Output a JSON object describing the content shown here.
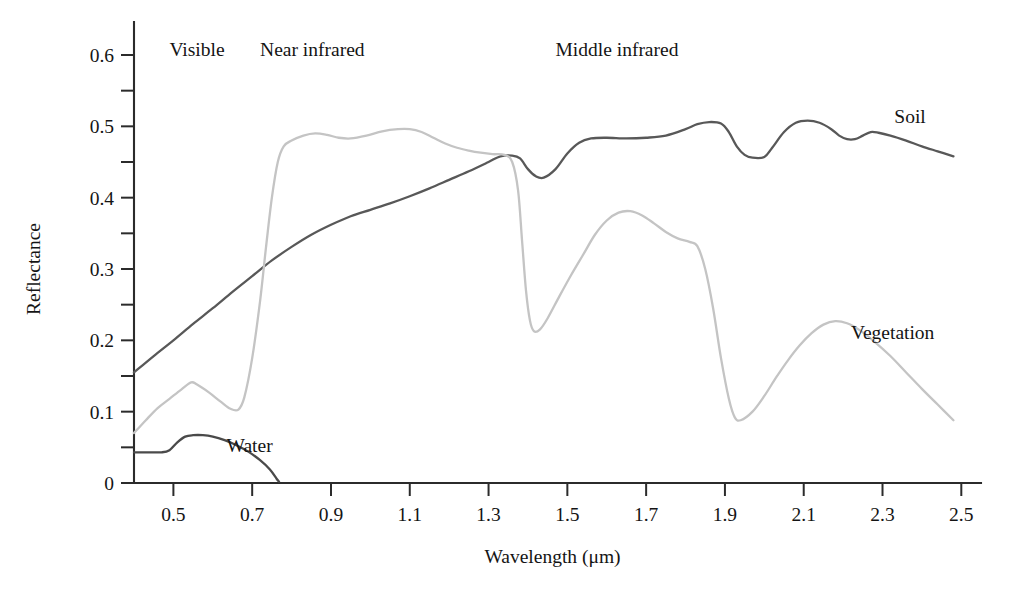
{
  "chart_data": {
    "type": "line",
    "title": "",
    "xlabel": "Wavelength (μm)",
    "ylabel": "Reflectance",
    "xlim": [
      0.4,
      2.55
    ],
    "ylim": [
      0,
      0.625
    ],
    "grid": false,
    "legend_position": "inline-right",
    "xticks": [
      0.5,
      0.7,
      0.9,
      1.1,
      1.3,
      1.5,
      1.7,
      1.9,
      2.1,
      2.3,
      2.5
    ],
    "xticklabels": [
      "0.5",
      "0.7",
      "0.9",
      "1.1",
      "1.3",
      "1.5",
      "1.7",
      "1.9",
      "2.1",
      "2.3",
      "2.5"
    ],
    "xticks_minor": [
      0.4,
      0.6,
      0.8,
      1.0,
      1.2,
      1.4,
      1.6,
      1.8,
      2.0,
      2.2,
      2.4
    ],
    "yticks": [
      0,
      0.1,
      0.2,
      0.3,
      0.4,
      0.5,
      0.6
    ],
    "yticklabels": [
      "0",
      "0.1",
      "0.2",
      "0.3",
      "0.4",
      "0.5",
      "0.6"
    ],
    "yticks_minor": [
      0.05,
      0.15,
      0.25,
      0.35,
      0.45,
      0.55
    ],
    "band_annotations": [
      {
        "name": "visible",
        "label": "Visible",
        "x": 0.49
      },
      {
        "name": "near-infrared",
        "label": "Near infrared",
        "x": 0.72
      },
      {
        "name": "middle-infrared",
        "label": "Middle infrared",
        "x": 1.47
      }
    ],
    "series": [
      {
        "name": "soil",
        "label": "Soil",
        "color": "#585858",
        "label_x": 2.33,
        "label_y": 0.515,
        "points": [
          [
            0.4,
            0.155
          ],
          [
            0.45,
            0.178
          ],
          [
            0.5,
            0.2
          ],
          [
            0.55,
            0.223
          ],
          [
            0.6,
            0.245
          ],
          [
            0.65,
            0.268
          ],
          [
            0.7,
            0.29
          ],
          [
            0.75,
            0.312
          ],
          [
            0.8,
            0.331
          ],
          [
            0.85,
            0.348
          ],
          [
            0.9,
            0.362
          ],
          [
            0.95,
            0.374
          ],
          [
            1.0,
            0.383
          ],
          [
            1.05,
            0.392
          ],
          [
            1.1,
            0.402
          ],
          [
            1.15,
            0.413
          ],
          [
            1.2,
            0.425
          ],
          [
            1.25,
            0.437
          ],
          [
            1.3,
            0.45
          ],
          [
            1.33,
            0.458
          ],
          [
            1.36,
            0.459
          ],
          [
            1.38,
            0.455
          ],
          [
            1.4,
            0.44
          ],
          [
            1.42,
            0.43
          ],
          [
            1.44,
            0.428
          ],
          [
            1.47,
            0.44
          ],
          [
            1.5,
            0.462
          ],
          [
            1.53,
            0.477
          ],
          [
            1.56,
            0.483
          ],
          [
            1.6,
            0.484
          ],
          [
            1.65,
            0.483
          ],
          [
            1.7,
            0.484
          ],
          [
            1.75,
            0.487
          ],
          [
            1.8,
            0.496
          ],
          [
            1.83,
            0.503
          ],
          [
            1.86,
            0.506
          ],
          [
            1.89,
            0.504
          ],
          [
            1.91,
            0.492
          ],
          [
            1.93,
            0.472
          ],
          [
            1.95,
            0.46
          ],
          [
            1.97,
            0.456
          ],
          [
            2.0,
            0.457
          ],
          [
            2.02,
            0.47
          ],
          [
            2.05,
            0.492
          ],
          [
            2.08,
            0.505
          ],
          [
            2.11,
            0.508
          ],
          [
            2.14,
            0.505
          ],
          [
            2.17,
            0.496
          ],
          [
            2.19,
            0.487
          ],
          [
            2.21,
            0.482
          ],
          [
            2.23,
            0.482
          ],
          [
            2.25,
            0.487
          ],
          [
            2.27,
            0.492
          ],
          [
            2.29,
            0.491
          ],
          [
            2.32,
            0.487
          ],
          [
            2.36,
            0.48
          ],
          [
            2.4,
            0.472
          ],
          [
            2.44,
            0.465
          ],
          [
            2.48,
            0.458
          ]
        ]
      },
      {
        "name": "vegetation",
        "label": "Vegetation",
        "color": "#c4c4c4",
        "label_x": 2.22,
        "label_y": 0.212,
        "points": [
          [
            0.4,
            0.07
          ],
          [
            0.43,
            0.088
          ],
          [
            0.46,
            0.105
          ],
          [
            0.49,
            0.118
          ],
          [
            0.52,
            0.131
          ],
          [
            0.545,
            0.141
          ],
          [
            0.56,
            0.138
          ],
          [
            0.59,
            0.127
          ],
          [
            0.62,
            0.114
          ],
          [
            0.645,
            0.104
          ],
          [
            0.665,
            0.103
          ],
          [
            0.68,
            0.12
          ],
          [
            0.7,
            0.175
          ],
          [
            0.72,
            0.255
          ],
          [
            0.735,
            0.33
          ],
          [
            0.75,
            0.4
          ],
          [
            0.765,
            0.45
          ],
          [
            0.78,
            0.472
          ],
          [
            0.8,
            0.48
          ],
          [
            0.83,
            0.487
          ],
          [
            0.86,
            0.49
          ],
          [
            0.89,
            0.488
          ],
          [
            0.92,
            0.484
          ],
          [
            0.95,
            0.483
          ],
          [
            0.99,
            0.487
          ],
          [
            1.03,
            0.493
          ],
          [
            1.07,
            0.496
          ],
          [
            1.1,
            0.496
          ],
          [
            1.13,
            0.492
          ],
          [
            1.16,
            0.484
          ],
          [
            1.19,
            0.476
          ],
          [
            1.22,
            0.47
          ],
          [
            1.25,
            0.466
          ],
          [
            1.28,
            0.463
          ],
          [
            1.31,
            0.461
          ],
          [
            1.34,
            0.46
          ],
          [
            1.36,
            0.45
          ],
          [
            1.375,
            0.41
          ],
          [
            1.385,
            0.34
          ],
          [
            1.395,
            0.27
          ],
          [
            1.405,
            0.228
          ],
          [
            1.415,
            0.213
          ],
          [
            1.43,
            0.215
          ],
          [
            1.45,
            0.231
          ],
          [
            1.48,
            0.262
          ],
          [
            1.51,
            0.292
          ],
          [
            1.54,
            0.32
          ],
          [
            1.57,
            0.348
          ],
          [
            1.6,
            0.368
          ],
          [
            1.63,
            0.379
          ],
          [
            1.66,
            0.381
          ],
          [
            1.69,
            0.375
          ],
          [
            1.72,
            0.364
          ],
          [
            1.75,
            0.352
          ],
          [
            1.78,
            0.343
          ],
          [
            1.81,
            0.338
          ],
          [
            1.83,
            0.332
          ],
          [
            1.85,
            0.3
          ],
          [
            1.87,
            0.245
          ],
          [
            1.89,
            0.175
          ],
          [
            1.91,
            0.118
          ],
          [
            1.925,
            0.092
          ],
          [
            1.94,
            0.088
          ],
          [
            1.97,
            0.1
          ],
          [
            2.0,
            0.122
          ],
          [
            2.03,
            0.148
          ],
          [
            2.06,
            0.172
          ],
          [
            2.09,
            0.193
          ],
          [
            2.12,
            0.21
          ],
          [
            2.15,
            0.222
          ],
          [
            2.18,
            0.227
          ],
          [
            2.21,
            0.224
          ],
          [
            2.24,
            0.215
          ],
          [
            2.28,
            0.198
          ],
          [
            2.32,
            0.178
          ],
          [
            2.36,
            0.155
          ],
          [
            2.4,
            0.132
          ],
          [
            2.44,
            0.11
          ],
          [
            2.48,
            0.088
          ]
        ]
      },
      {
        "name": "water",
        "label": "Water",
        "color": "#4a4a4a",
        "label_x": 0.635,
        "label_y": 0.053,
        "points": [
          [
            0.4,
            0.043
          ],
          [
            0.44,
            0.043
          ],
          [
            0.47,
            0.043
          ],
          [
            0.49,
            0.046
          ],
          [
            0.51,
            0.057
          ],
          [
            0.53,
            0.065
          ],
          [
            0.55,
            0.067
          ],
          [
            0.575,
            0.067
          ],
          [
            0.6,
            0.065
          ],
          [
            0.63,
            0.06
          ],
          [
            0.66,
            0.053
          ],
          [
            0.69,
            0.044
          ],
          [
            0.72,
            0.032
          ],
          [
            0.745,
            0.019
          ],
          [
            0.762,
            0.006
          ],
          [
            0.768,
            0.002
          ]
        ]
      }
    ]
  }
}
